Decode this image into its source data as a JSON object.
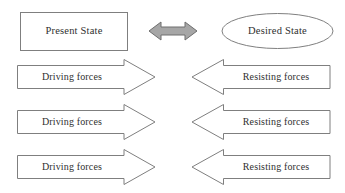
{
  "diagram": {
    "type": "force-field-analysis",
    "states": {
      "present": {
        "label": "Present State",
        "shape": "rectangle"
      },
      "desired": {
        "label": "Desired State",
        "shape": "ellipse"
      },
      "connector": {
        "icon": "double-headed-arrow-icon",
        "fill": "#a6a6a6",
        "stroke": "#6e6e6e"
      }
    },
    "force_rows": [
      {
        "driving": "Driving forces",
        "resisting": "Resisting forces"
      },
      {
        "driving": "Driving forces",
        "resisting": "Resisting forces"
      },
      {
        "driving": "Driving forces",
        "resisting": "Resisting forces"
      }
    ],
    "colors": {
      "background": "#ffffff",
      "stroke": "#7f7f7f",
      "shape_fill": "#ffffff",
      "text": "#2f2f2f"
    }
  }
}
